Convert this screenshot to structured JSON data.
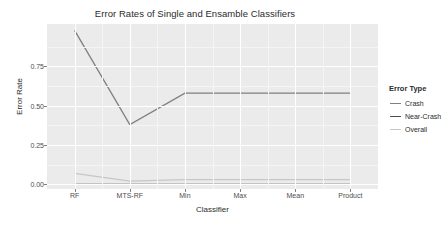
{
  "chart_data": {
    "type": "line",
    "title": "Error Rates of Single and Ensamble Classifiers",
    "xlabel": "Classifier",
    "ylabel": "Error Rate",
    "categories": [
      "RF",
      "MTS-RF",
      "Min",
      "Max",
      "Mean",
      "Product"
    ],
    "yticks": [
      "0.00",
      "0.25",
      "0.50",
      "0.75"
    ],
    "ytick_values": [
      0.0,
      0.25,
      0.5,
      0.75
    ],
    "ylim": [
      -0.03,
      1.02
    ],
    "grid": true,
    "legend_position": "right",
    "legend_title": "Error Type",
    "series": [
      {
        "name": "Crash",
        "color": "#808080",
        "values": [
          0.98,
          0.38,
          0.58,
          0.58,
          0.58,
          0.58
        ]
      },
      {
        "name": "Near-Crash",
        "color": "#4d4d4d",
        "values": [
          0.0,
          0.0,
          0.0,
          0.0,
          0.0,
          0.0
        ]
      },
      {
        "name": "Overall",
        "color": "#c6c6c6",
        "values": [
          0.07,
          0.02,
          0.03,
          0.03,
          0.03,
          0.03
        ]
      }
    ]
  },
  "theme": {
    "panel_bg": "#ebebeb",
    "grid_major": "#ffffff",
    "grid_minor": "#f5f5f5",
    "text": "#2b2b2b",
    "axis_text": "#4d4d4d"
  }
}
